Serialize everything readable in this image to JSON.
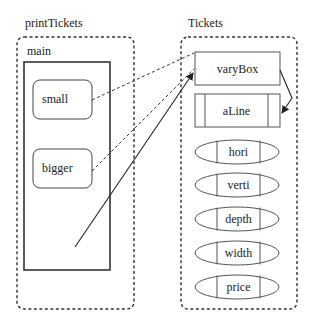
{
  "diagram": {
    "left_container": {
      "label": "printTickets",
      "frame": {
        "label": "main",
        "items": [
          {
            "label": "small"
          },
          {
            "label": "bigger"
          }
        ]
      }
    },
    "right_container": {
      "label": "Tickets",
      "items": [
        {
          "label": "varyBox",
          "shape": "rectangle"
        },
        {
          "label": "aLine",
          "shape": "rectangle-with-side-bars"
        },
        {
          "label": "hori",
          "shape": "ellipse-with-bars"
        },
        {
          "label": "verti",
          "shape": "ellipse-with-bars"
        },
        {
          "label": "depth",
          "shape": "ellipse-with-bars"
        },
        {
          "label": "width",
          "shape": "ellipse-with-bars"
        },
        {
          "label": "price",
          "shape": "ellipse-with-bars"
        }
      ]
    },
    "connections": [
      {
        "from": "small",
        "to": "varyBox",
        "style": "dashed"
      },
      {
        "from": "bigger",
        "to": "varyBox",
        "style": "dashed"
      },
      {
        "from": "main",
        "to": "varyBox",
        "style": "solid-arrow"
      },
      {
        "from": "varyBox",
        "to": "aLine",
        "style": "solid-arrow"
      }
    ],
    "colors": {
      "stroke": "#333333",
      "text": "#222222",
      "background": "#ffffff"
    }
  }
}
